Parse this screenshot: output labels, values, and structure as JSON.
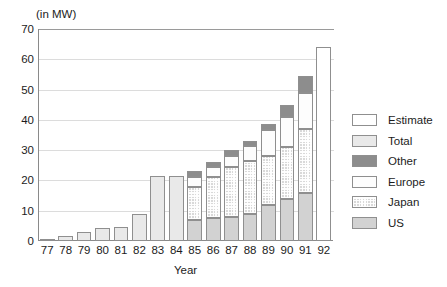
{
  "chart_data": {
    "type": "bar",
    "title": "",
    "subtitle": "",
    "unit_label": "(in MW)",
    "xlabel": "Year",
    "ylabel": "",
    "ylim": [
      0,
      70
    ],
    "ytick_values": [
      0,
      10,
      20,
      30,
      40,
      50,
      60,
      70
    ],
    "ytick_labels": [
      "0",
      "10",
      "20",
      "30",
      "40",
      "50",
      "60",
      "70"
    ],
    "grid": true,
    "stacked": true,
    "legend_position": "right",
    "categories": [
      "77",
      "78",
      "79",
      "80",
      "81",
      "82",
      "83",
      "84",
      "85",
      "86",
      "87",
      "88",
      "89",
      "90",
      "91",
      "92"
    ],
    "series": [
      {
        "name": "US",
        "values": [
          0,
          0,
          0,
          0,
          0,
          0,
          0,
          0,
          7.0,
          7.5,
          8.0,
          9.0,
          12.0,
          14.0,
          16.0,
          0
        ]
      },
      {
        "name": "Japan",
        "values": [
          0,
          0,
          0,
          0,
          0,
          0,
          0,
          0,
          11.0,
          13.5,
          16.5,
          17.5,
          16.0,
          17.0,
          21.0,
          0
        ]
      },
      {
        "name": "Europe",
        "values": [
          0,
          0,
          0,
          0,
          0,
          0,
          0,
          0,
          3.0,
          3.5,
          3.5,
          5.0,
          8.5,
          10.0,
          12.0,
          0
        ]
      },
      {
        "name": "Other",
        "values": [
          0,
          0,
          0,
          0,
          0,
          0,
          0,
          0,
          2.0,
          1.5,
          2.0,
          1.5,
          2.0,
          4.0,
          5.5,
          0
        ]
      },
      {
        "name": "Total",
        "values": [
          0.7,
          1.5,
          3.0,
          4.3,
          4.6,
          9.0,
          21.5,
          21.5,
          0,
          0,
          0,
          0,
          0,
          0,
          0,
          0
        ]
      },
      {
        "name": "Estimate",
        "values": [
          0,
          0,
          0,
          0,
          0,
          0,
          0,
          0,
          0,
          0,
          0,
          0,
          0,
          0,
          0,
          64.0
        ]
      }
    ],
    "stack_totals": [
      0.7,
      1.5,
      3.0,
      4.3,
      4.6,
      9.0,
      21.5,
      21.5,
      23.0,
      26.0,
      30.0,
      33.0,
      38.5,
      45.0,
      54.5,
      64.0
    ],
    "legend": [
      {
        "label": "Estimate",
        "color": "#ffffff",
        "pattern": "solid"
      },
      {
        "label": "Total",
        "color": "#e9e9e9",
        "pattern": "solid"
      },
      {
        "label": "Other",
        "color": "#8d8d8d",
        "pattern": "solid"
      },
      {
        "label": "Europe",
        "color": "#fdfdfd",
        "pattern": "solid"
      },
      {
        "label": "Japan",
        "color": "#d9d9d9",
        "pattern": "crosshatch"
      },
      {
        "label": "US",
        "color": "#d2d2d2",
        "pattern": "solid"
      }
    ],
    "colors": {
      "us": "#d2d2d2",
      "japan": "#d9d9d9",
      "europe": "#fdfdfd",
      "other": "#8d8d8d",
      "total": "#e9e9e9",
      "estimate": "#ffffff",
      "axis": "#8a8a8a",
      "grid": "#dcdcdc",
      "text": "#1c1c1c"
    }
  }
}
